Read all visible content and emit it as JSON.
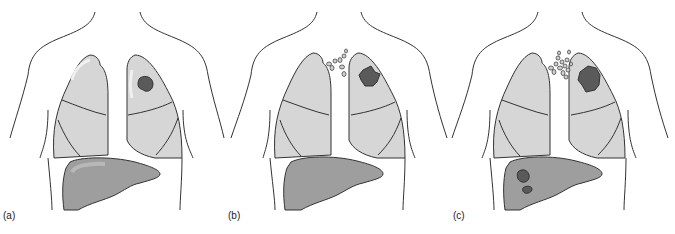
{
  "figure": {
    "panels": [
      {
        "label": "(a)",
        "stage": "primary-tumor",
        "lymph_nodes": 0,
        "liver_mets": 0
      },
      {
        "label": "(b)",
        "stage": "lymph-node-spread",
        "lymph_nodes": 8,
        "liver_mets": 0
      },
      {
        "label": "(c)",
        "stage": "distant-metastasis",
        "lymph_nodes": 14,
        "liver_mets": 2
      }
    ],
    "colors": {
      "outline": "#333333",
      "lung_fill": "#d6d6d6",
      "lung_highlight": "#ececec",
      "liver_fill": "#9e9e9e",
      "liver_highlight": "#b5b5b5",
      "tumor_fill": "#5a5a5a",
      "node_fill": "#cfcfcf"
    }
  }
}
